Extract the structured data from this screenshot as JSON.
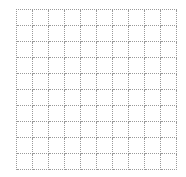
{
  "grid": {
    "rows": 10,
    "columns": 10,
    "line_style": "dotted",
    "line_color": "#9a9a9a",
    "background": "#ffffff"
  }
}
